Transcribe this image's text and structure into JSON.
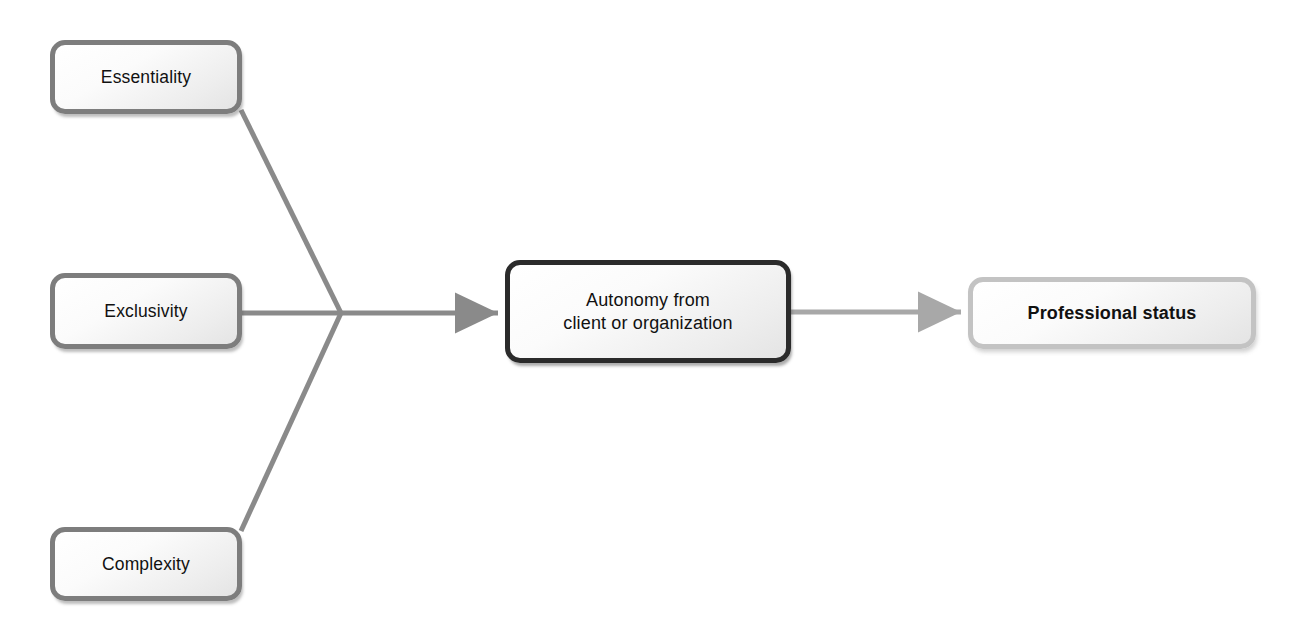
{
  "diagram": {
    "type": "flow-diagram",
    "background_color": "#ffffff",
    "nodes": [
      {
        "id": "essentiality",
        "label": "Essentiality",
        "role": "input",
        "border_color": "#7d7d7d",
        "fill_color": "#f0f0f0",
        "text_color": "#111111",
        "bold": false
      },
      {
        "id": "exclusivity",
        "label": "Exclusivity",
        "role": "input",
        "border_color": "#7d7d7d",
        "fill_color": "#f0f0f0",
        "text_color": "#111111",
        "bold": false
      },
      {
        "id": "complexity",
        "label": "Complexity",
        "role": "input",
        "border_color": "#7d7d7d",
        "fill_color": "#f0f0f0",
        "text_color": "#111111",
        "bold": false
      },
      {
        "id": "autonomy",
        "label": "Autonomy from\nclient or organization",
        "role": "mediator",
        "border_color": "#2b2b2b",
        "fill_color": "#f0f0f0",
        "text_color": "#111111",
        "bold": false
      },
      {
        "id": "professional-status",
        "label": "Professional status",
        "role": "outcome",
        "border_color": "#c3c3c3",
        "fill_color": "#efefef",
        "text_color": "#111111",
        "bold": true
      }
    ],
    "connectors": [
      {
        "id": "essentiality-to-junction",
        "from": "essentiality",
        "to": "junction",
        "arrowhead": false,
        "color": "#8a8a8a"
      },
      {
        "id": "exclusivity-to-junction",
        "from": "exclusivity",
        "to": "junction",
        "arrowhead": false,
        "color": "#8a8a8a"
      },
      {
        "id": "complexity-to-junction",
        "from": "complexity",
        "to": "junction",
        "arrowhead": false,
        "color": "#8a8a8a"
      },
      {
        "id": "junction-to-autonomy",
        "from": "junction",
        "to": "autonomy",
        "arrowhead": true,
        "color": "#8a8a8a"
      },
      {
        "id": "autonomy-to-status",
        "from": "autonomy",
        "to": "professional-status",
        "arrowhead": true,
        "color": "#a8a8a8"
      }
    ]
  }
}
